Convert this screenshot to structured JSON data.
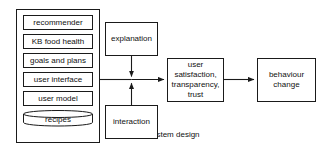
{
  "diagram": {
    "background_color": "#ffffff",
    "line_color": "#1a1a1a",
    "text_color": "#111111",
    "container": {
      "label": "system design",
      "components": [
        {
          "label": "recommender",
          "shape": "rect"
        },
        {
          "label": "KB food health",
          "shape": "rect"
        },
        {
          "label": "goals and plans",
          "shape": "rect"
        },
        {
          "label": "user interface",
          "shape": "rect"
        },
        {
          "label": "user model",
          "shape": "rect"
        },
        {
          "label": "recipes",
          "shape": "cylinder"
        }
      ]
    },
    "nodes": [
      {
        "id": "explanation",
        "label": "explanation"
      },
      {
        "id": "interaction",
        "label": "interaction"
      },
      {
        "id": "satisfaction",
        "label": "user\nsatisfaction,\ntransparency,\ntrust"
      },
      {
        "id": "behaviour",
        "label": "behaviour\nchange"
      }
    ],
    "edges": [
      {
        "from": "system design",
        "to": "junction",
        "arrow": false
      },
      {
        "from": "explanation",
        "to": "junction",
        "arrow": true
      },
      {
        "from": "interaction",
        "to": "junction",
        "arrow": true
      },
      {
        "from": "junction",
        "to": "satisfaction",
        "arrow": true
      },
      {
        "from": "satisfaction",
        "to": "behaviour",
        "arrow": true
      }
    ]
  }
}
